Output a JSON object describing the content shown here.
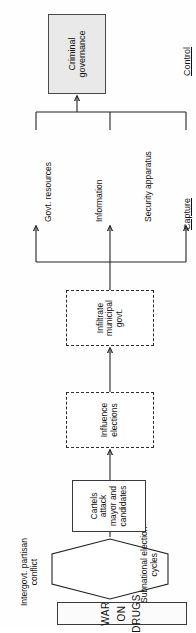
{
  "diagram": {
    "orientation": "rotated-90-ccw",
    "source_node": {
      "label": "WAR ON DRUGS",
      "letters": [
        "W",
        "A",
        "R",
        "O",
        "N",
        "D",
        "R",
        "U",
        "G",
        "S"
      ],
      "line1": "WAR",
      "line2": "ON",
      "line3": "DRUGS"
    },
    "conditioning_hexagon": {
      "shape": "hexagon",
      "fill": "#ffffff",
      "label_top": "Intergovt. partisan\nconflict",
      "label_top_line1": "Intergovt. partisan",
      "label_top_line2": "conflict",
      "label_bottom_line1": "Subnational election",
      "label_bottom_line2": "cycles"
    },
    "nodes": [
      {
        "id": "cartels-attack",
        "style": "solid",
        "line1": "Cartels attack",
        "line2": "mayor and",
        "line3": "candidates"
      },
      {
        "id": "influence-elections",
        "style": "dashed",
        "line1": "Influence",
        "line2": "elections"
      },
      {
        "id": "infiltrate-govt",
        "style": "dashed",
        "line1": "Infiltrate",
        "line2": "municipal",
        "line3": "govt."
      },
      {
        "id": "criminal-governance",
        "style": "solid-shaded",
        "fill": "#e9e9e9",
        "line1": "Criminal",
        "line2": "governance"
      }
    ],
    "capture_outcomes": [
      {
        "label": "Govt. resources"
      },
      {
        "label": "Information"
      },
      {
        "label": "Security apparatus"
      }
    ],
    "sections": [
      {
        "id": "capture",
        "label": "Capture"
      },
      {
        "id": "control",
        "label": "Control"
      }
    ],
    "colors": {
      "stroke": "#222222",
      "shaded_fill": "#e9e9e9",
      "background": "#fefefe",
      "text": "#111111"
    }
  }
}
